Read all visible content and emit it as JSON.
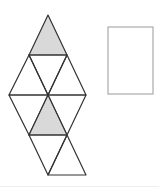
{
  "diagram": {
    "colors": {
      "stroke": "#333333",
      "shade": "#d9d9d9",
      "box_stroke": "#aaaaaa",
      "background": "#ffffff"
    },
    "triangles": [
      {
        "points": "48,15 29,55 67,55",
        "shaded": true
      },
      {
        "points": "29,55 67,55 48,95",
        "shaded": false
      },
      {
        "points": "29,55 9,95 48,95",
        "shaded": false
      },
      {
        "points": "67,55 48,95 86,95",
        "shaded": false
      },
      {
        "points": "9,95 48,95 29,135",
        "shaded": false
      },
      {
        "points": "48,95 86,95 67,135",
        "shaded": false
      },
      {
        "points": "48,95 29,135 67,135",
        "shaded": true
      },
      {
        "points": "29,135 67,135 48,175",
        "shaded": false
      },
      {
        "points": "67,135 48,175 86,175",
        "shaded": false
      }
    ],
    "answer_box": {
      "x": 108,
      "y": 27,
      "width": 45,
      "height": 67
    }
  }
}
